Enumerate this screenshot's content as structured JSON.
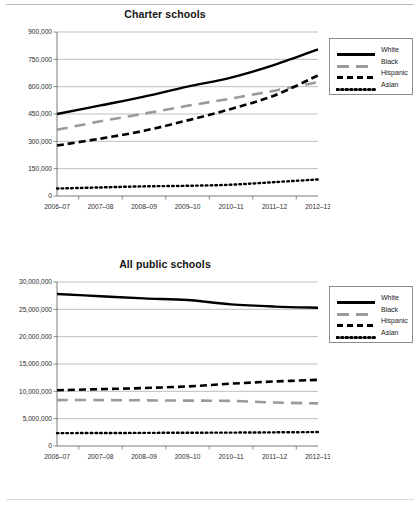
{
  "figures": [
    {
      "id": "charter",
      "title": "Charter schools",
      "legend": [
        {
          "label": "White",
          "style": "solid"
        },
        {
          "label": "Black",
          "style": "longdash"
        },
        {
          "label": "Hispanic",
          "style": "dash"
        },
        {
          "label": "Asian",
          "style": "dot"
        }
      ]
    },
    {
      "id": "allpublic",
      "title": "All public schools",
      "legend": [
        {
          "label": "White",
          "style": "solid"
        },
        {
          "label": "Black",
          "style": "longdash"
        },
        {
          "label": "Hispanic",
          "style": "dash"
        },
        {
          "label": "Asian",
          "style": "dot"
        }
      ]
    }
  ],
  "chart_data": [
    {
      "type": "line",
      "title": "Charter schools",
      "xlabel": "",
      "ylabel": "",
      "x": [
        "2006–07",
        "2007–08",
        "2008–09",
        "2009–10",
        "2010–11",
        "2011–12",
        "2012–13"
      ],
      "categories": [
        "2006–07",
        "2007–08",
        "2008–09",
        "2009–10",
        "2010–11",
        "2011–12",
        "2012–13"
      ],
      "yticks": [
        0,
        150000,
        300000,
        450000,
        600000,
        750000,
        900000
      ],
      "ytick_labels": [
        "0",
        "150,000",
        "300,000",
        "450,000",
        "600,000",
        "750,000",
        "900,000"
      ],
      "ylim": [
        0,
        900000
      ],
      "grid": "horizontal",
      "legend_position": "right",
      "series": [
        {
          "name": "White",
          "style": "solid",
          "color": "#000000",
          "values": [
            450000,
            497000,
            545000,
            600000,
            650000,
            720000,
            805000
          ]
        },
        {
          "name": "Black",
          "style": "longdash",
          "color": "#9a9a9a",
          "values": [
            363000,
            410000,
            452000,
            495000,
            535000,
            578000,
            625000
          ]
        },
        {
          "name": "Hispanic",
          "style": "dash",
          "color": "#000000",
          "values": [
            277000,
            315000,
            358000,
            415000,
            478000,
            552000,
            662000
          ]
        },
        {
          "name": "Asian",
          "style": "dot",
          "color": "#000000",
          "values": [
            41000,
            47000,
            53000,
            56000,
            62000,
            76000,
            91000
          ]
        }
      ]
    },
    {
      "type": "line",
      "title": "All public schools",
      "xlabel": "",
      "ylabel": "",
      "x": [
        "2006–07",
        "2007–08",
        "2008–09",
        "2009–10",
        "2010–11",
        "2011–12",
        "2012–13"
      ],
      "categories": [
        "2006–07",
        "2007–08",
        "2008–09",
        "2009–10",
        "2010–11",
        "2011–12",
        "2012–13"
      ],
      "yticks": [
        0,
        5000000,
        10000000,
        15000000,
        20000000,
        25000000,
        30000000
      ],
      "ytick_labels": [
        "0",
        "5,000,000",
        "10,000,000",
        "15,000,000",
        "20,000,000",
        "25,000,000",
        "30,000,000"
      ],
      "ylim": [
        0,
        30000000
      ],
      "grid": "horizontal",
      "legend_position": "right",
      "series": [
        {
          "name": "White",
          "style": "solid",
          "color": "#000000",
          "values": [
            27800000,
            27400000,
            27000000,
            26700000,
            25900000,
            25500000,
            25300000
          ]
        },
        {
          "name": "Black",
          "style": "longdash",
          "color": "#9a9a9a",
          "values": [
            8400000,
            8400000,
            8350000,
            8300000,
            8250000,
            7950000,
            7800000
          ]
        },
        {
          "name": "Hispanic",
          "style": "dash",
          "color": "#000000",
          "values": [
            10200000,
            10400000,
            10600000,
            10900000,
            11400000,
            11800000,
            12100000
          ]
        },
        {
          "name": "Asian",
          "style": "dot",
          "color": "#000000",
          "values": [
            2350000,
            2380000,
            2400000,
            2430000,
            2450000,
            2500000,
            2550000
          ]
        }
      ]
    }
  ]
}
